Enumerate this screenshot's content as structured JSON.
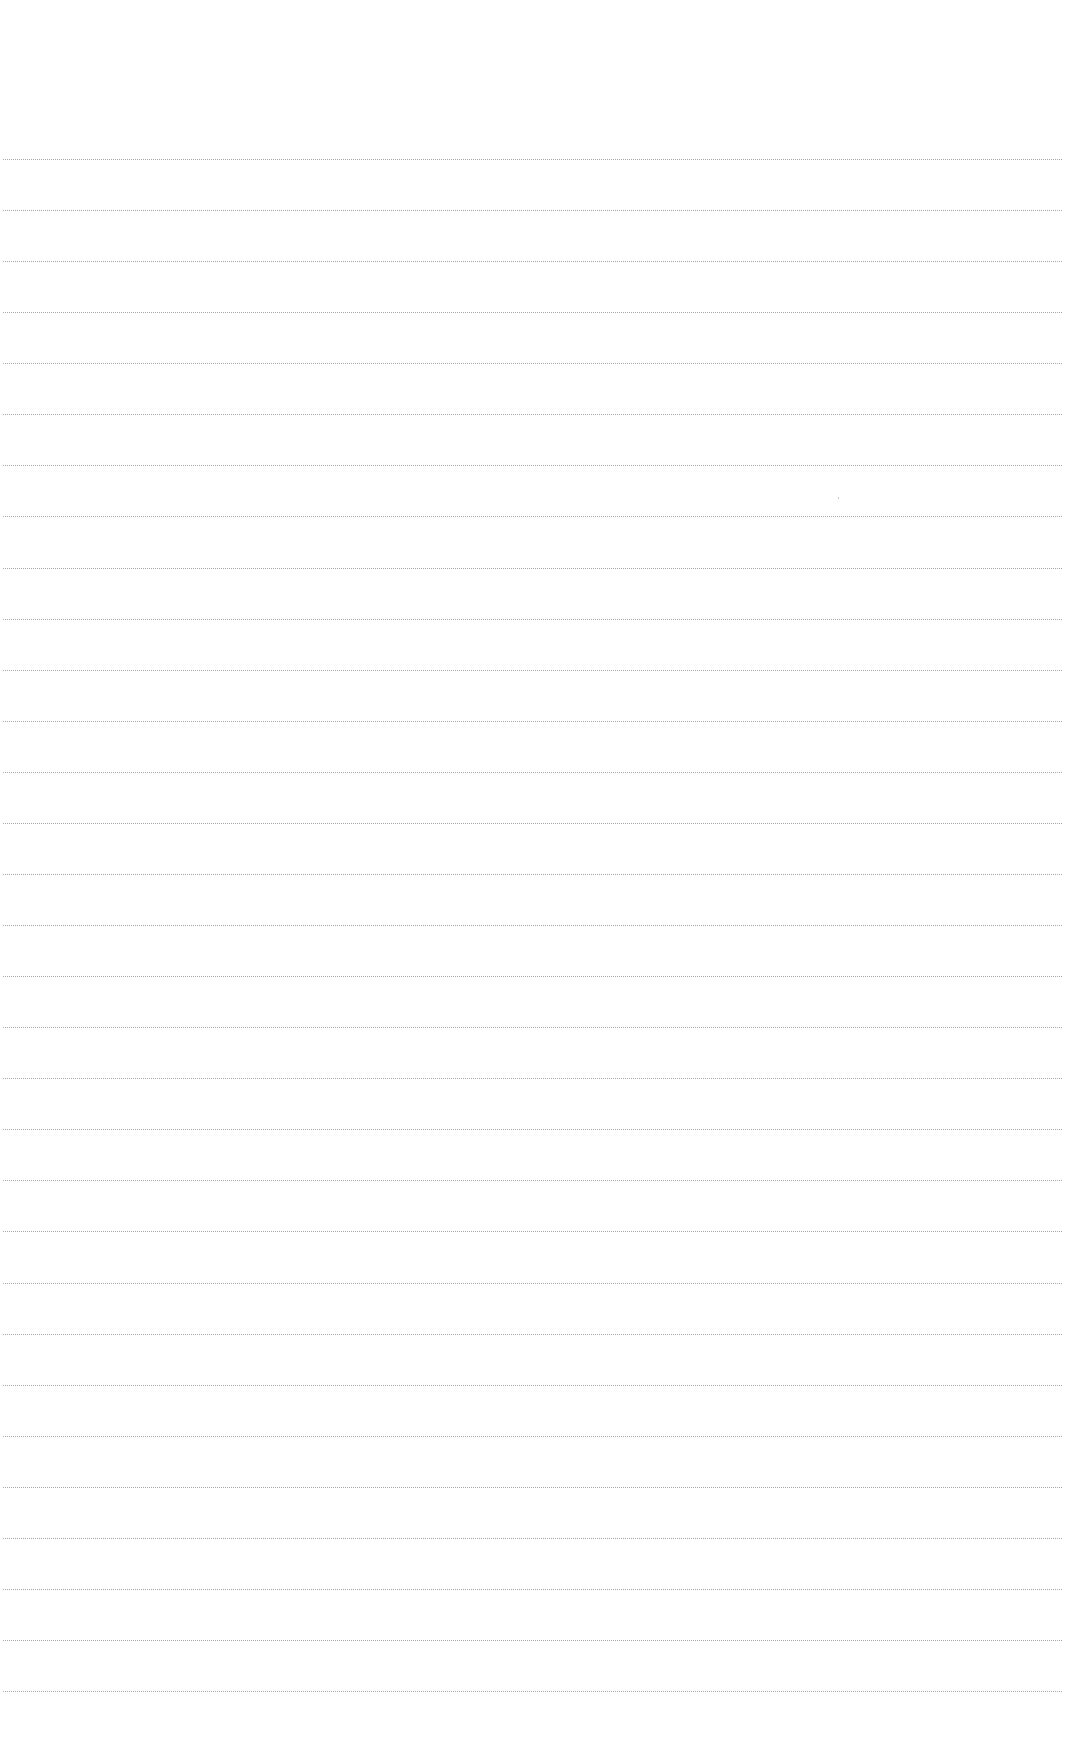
{
  "page": {
    "type": "blank-lined-paper",
    "background_color": "#ffffff",
    "rule_color": "#8a8a8a",
    "rule_style": "dotted",
    "rules": {
      "count": 31,
      "first_y": 159,
      "spacing": 51.07,
      "x_start": 3,
      "x_end": 1062
    },
    "text_content": []
  }
}
